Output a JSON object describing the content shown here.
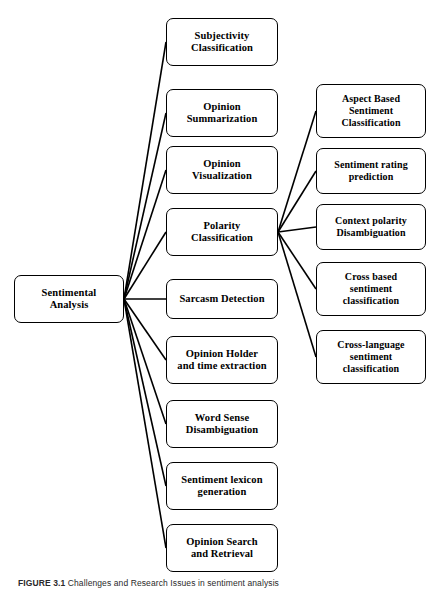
{
  "figure": {
    "caption_label": "FIGURE 3.1",
    "caption_text": "Challenges and Research Issues in sentiment analysis"
  },
  "diagram": {
    "type": "tree",
    "root": {
      "id": "sentimental-analysis",
      "label": "Sentimental\nAnalysis",
      "x": 14,
      "y": 275,
      "w": 110,
      "h": 48,
      "font_size": 10.5
    },
    "level1": [
      {
        "id": "subjectivity-classification",
        "label": "Subjectivity\nClassification",
        "x": 166,
        "y": 18,
        "w": 112,
        "h": 48,
        "font_size": 10.5
      },
      {
        "id": "opinion-summarization",
        "label": "Opinion\nSummarization",
        "x": 166,
        "y": 89,
        "w": 112,
        "h": 48,
        "font_size": 10.5
      },
      {
        "id": "opinion-visualization",
        "label": "Opinion\nVisualization",
        "x": 166,
        "y": 146,
        "w": 112,
        "h": 48,
        "font_size": 10.5
      },
      {
        "id": "polarity-classification",
        "label": "Polarity\nClassification",
        "x": 166,
        "y": 208,
        "w": 112,
        "h": 48,
        "font_size": 10.5
      },
      {
        "id": "sarcasm-detection",
        "label": "Sarcasm Detection",
        "x": 166,
        "y": 279,
        "w": 112,
        "h": 40,
        "font_size": 10.5
      },
      {
        "id": "opinion-holder-and-time-extraction",
        "label": "Opinion Holder\nand time extraction",
        "x": 166,
        "y": 336,
        "w": 112,
        "h": 48,
        "font_size": 10.5
      },
      {
        "id": "word-sense-disambiguation",
        "label": "Word Sense\nDisambiguation",
        "x": 166,
        "y": 400,
        "w": 112,
        "h": 48,
        "font_size": 10.5
      },
      {
        "id": "sentiment-lexicon-generation",
        "label": "Sentiment lexicon\ngeneration",
        "x": 166,
        "y": 462,
        "w": 112,
        "h": 48,
        "font_size": 10.5
      },
      {
        "id": "opinion-search-and-retrieval",
        "label": "Opinion Search\nand Retrieval",
        "x": 166,
        "y": 524,
        "w": 112,
        "h": 48,
        "font_size": 10.5
      }
    ],
    "level2": [
      {
        "id": "aspect-based-sentiment-classification",
        "label": "Aspect Based\nSentiment\nClassification",
        "x": 316,
        "y": 84,
        "w": 110,
        "h": 54,
        "font_size": 10
      },
      {
        "id": "sentiment-rating-prediction",
        "label": "Sentiment rating\nprediction",
        "x": 316,
        "y": 148,
        "w": 110,
        "h": 46,
        "font_size": 10
      },
      {
        "id": "context-polarity-disambiguation",
        "label": "Context polarity\nDisambiguation",
        "x": 316,
        "y": 204,
        "w": 110,
        "h": 46,
        "font_size": 10
      },
      {
        "id": "cross-based-sentiment-classification",
        "label": "Cross based\nsentiment\nclassification",
        "x": 316,
        "y": 262,
        "w": 110,
        "h": 54,
        "font_size": 10
      },
      {
        "id": "cross-language-sentiment-classification",
        "label": "Cross-language\nsentiment\nclassification",
        "x": 316,
        "y": 330,
        "w": 110,
        "h": 54,
        "font_size": 10
      }
    ],
    "edges_from_root": [
      {
        "from": "sentimental-analysis",
        "to": "subjectivity-classification"
      },
      {
        "from": "sentimental-analysis",
        "to": "opinion-summarization"
      },
      {
        "from": "sentimental-analysis",
        "to": "opinion-visualization"
      },
      {
        "from": "sentimental-analysis",
        "to": "polarity-classification"
      },
      {
        "from": "sentimental-analysis",
        "to": "sarcasm-detection"
      },
      {
        "from": "sentimental-analysis",
        "to": "opinion-holder-and-time-extraction"
      },
      {
        "from": "sentimental-analysis",
        "to": "word-sense-disambiguation"
      },
      {
        "from": "sentimental-analysis",
        "to": "sentiment-lexicon-generation"
      },
      {
        "from": "sentimental-analysis",
        "to": "opinion-search-and-retrieval"
      }
    ],
    "edges_from_polarity": [
      {
        "from": "polarity-classification",
        "to": "aspect-based-sentiment-classification"
      },
      {
        "from": "polarity-classification",
        "to": "sentiment-rating-prediction"
      },
      {
        "from": "polarity-classification",
        "to": "context-polarity-disambiguation"
      },
      {
        "from": "polarity-classification",
        "to": "cross-based-sentiment-classification"
      },
      {
        "from": "polarity-classification",
        "to": "cross-language-sentiment-classification"
      }
    ],
    "style": {
      "line_color": "#000000",
      "line_width": 1.6,
      "node_border": "#000000",
      "node_fill": "#ffffff"
    }
  }
}
